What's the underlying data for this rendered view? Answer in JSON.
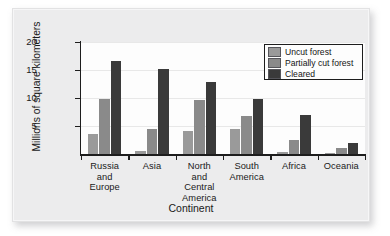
{
  "chart_data": {
    "type": "bar",
    "title": "",
    "subtitle": "",
    "xlabel": "Continent",
    "ylabel": "Millions of square kilometers",
    "categories": [
      "Russia and Europe",
      "Asia",
      "North and Central America",
      "South America",
      "Africa",
      "Oceania"
    ],
    "category_lines": [
      [
        "Russia",
        "and Europe"
      ],
      [
        "Asia"
      ],
      [
        "North",
        "and",
        "Central",
        "America"
      ],
      [
        "South",
        "America"
      ],
      [
        "Africa"
      ],
      [
        "Oceania"
      ]
    ],
    "series": [
      {
        "name": "Uncut forest",
        "color": "#9a9a9a",
        "values": [
          3.5,
          0.6,
          4.1,
          4.5,
          0.4,
          0.2
        ]
      },
      {
        "name": "Partially cut forest",
        "color": "#8a8a8a",
        "values": [
          9.9,
          4.5,
          9.7,
          6.8,
          2.5,
          1.0
        ]
      },
      {
        "name": "Cleared",
        "color": "#3a3a3a",
        "values": [
          16.6,
          15.1,
          12.8,
          9.9,
          6.9,
          2.0
        ]
      }
    ],
    "ylim": [
      0,
      20
    ],
    "yticks": [
      5,
      10,
      15,
      20
    ],
    "ytick_labels": [
      "5",
      "10",
      "15",
      "20"
    ],
    "grid": true,
    "legend_position": "top-right"
  },
  "legend": {
    "entries": [
      {
        "label": "Uncut forest"
      },
      {
        "label": "Partially cut forest"
      },
      {
        "label": "Cleared"
      }
    ]
  }
}
